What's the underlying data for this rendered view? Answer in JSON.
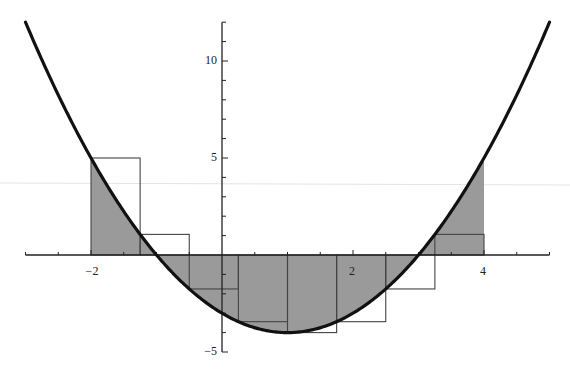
{
  "chart_data": {
    "type": "area",
    "title": "",
    "xlabel": "",
    "ylabel": "",
    "function": "f(x) = x^2 - 2x - 3",
    "curve": {
      "x_range": [
        -3,
        5
      ],
      "samples": [
        {
          "x": -3,
          "y": 12
        },
        {
          "x": -2,
          "y": 5
        },
        {
          "x": -1,
          "y": 0
        },
        {
          "x": 0,
          "y": -3
        },
        {
          "x": 1,
          "y": -4
        },
        {
          "x": 2,
          "y": -3
        },
        {
          "x": 3,
          "y": 0
        },
        {
          "x": 4,
          "y": 5
        },
        {
          "x": 5,
          "y": 12
        }
      ]
    },
    "shaded_region": {
      "x_from": -2,
      "x_to": 4,
      "description": "area between curve and x-axis"
    },
    "riemann_sum": {
      "method": "left endpoint",
      "n": 8,
      "dx": 0.75,
      "rectangles": [
        {
          "x_left": -2.0,
          "x_right": -1.25,
          "height": 5.0
        },
        {
          "x_left": -1.25,
          "x_right": -0.5,
          "height": 1.0625
        },
        {
          "x_left": -0.5,
          "x_right": 0.25,
          "height": -1.75
        },
        {
          "x_left": 0.25,
          "x_right": 1.0,
          "height": -3.4375
        },
        {
          "x_left": 1.0,
          "x_right": 1.75,
          "height": -4.0
        },
        {
          "x_left": 1.75,
          "x_right": 2.5,
          "height": -3.4375
        },
        {
          "x_left": 2.5,
          "x_right": 3.25,
          "height": -1.75
        },
        {
          "x_left": 3.25,
          "x_right": 4.0,
          "height": 1.0625
        }
      ]
    },
    "x_axis": {
      "range": [
        -3,
        5
      ],
      "major_ticks": [
        -2,
        2,
        4
      ],
      "tick_labels": [
        "-2",
        "2",
        "4"
      ],
      "minor_tick_step": 0.5
    },
    "y_axis": {
      "range": [
        -5,
        12
      ],
      "major_ticks": [
        -5,
        5,
        10
      ],
      "tick_labels": [
        "-5",
        "5",
        "10"
      ],
      "minor_tick_step": 1
    },
    "grid": false,
    "legend": null,
    "colors": {
      "curve": "#111111",
      "fill": "#9a9a9a",
      "rect_stroke": "#444444",
      "axis": "#222222"
    }
  },
  "labels": {
    "x_neg2": "−2",
    "x_2": "2",
    "x_4": "4",
    "y_10": "10",
    "y_5": "5",
    "y_neg5": "−5"
  }
}
